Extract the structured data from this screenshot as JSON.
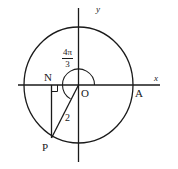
{
  "figure": {
    "type": "geometry-diagram",
    "background_color": "#ffffff",
    "stroke_color": "#1a1a1a",
    "axes": {
      "x_label": "x",
      "y_label": "y",
      "origin_label": "O"
    },
    "points": [
      {
        "id": "O",
        "label": "O",
        "x": 78.5,
        "y": 85
      },
      {
        "id": "A",
        "label": "A",
        "x": 133,
        "y": 85
      },
      {
        "id": "N",
        "label": "N",
        "x": 51,
        "y": 85
      },
      {
        "id": "P",
        "label": "P",
        "x": 51.5,
        "y": 138
      }
    ],
    "circle": {
      "center_x": 78.5,
      "center_y": 85,
      "radius_x": 54.5,
      "radius_y": 58
    },
    "angle": {
      "numerator": "4π",
      "denominator": "3",
      "start_degrees": 0,
      "sweep_degrees": 240,
      "arc_radius": 16
    },
    "segments": [
      {
        "id": "OP",
        "from": "O",
        "to": "P",
        "length_label": "2"
      },
      {
        "id": "NP",
        "from": "N",
        "to": "P",
        "length_label": ""
      }
    ],
    "right_angle_marker": {
      "at": "N",
      "size": 6
    }
  }
}
